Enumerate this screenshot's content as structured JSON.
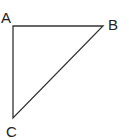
{
  "diagram": {
    "type": "triangle",
    "stroke_color": "#333333",
    "vertices": [
      {
        "label": "A",
        "x": 13,
        "y": 26,
        "label_x": 1,
        "label_y": 23
      },
      {
        "label": "B",
        "x": 103,
        "y": 26,
        "label_x": 108,
        "label_y": 30
      },
      {
        "label": "C",
        "x": 13,
        "y": 118,
        "label_x": 6,
        "label_y": 137
      }
    ],
    "edges": [
      {
        "from": "A",
        "to": "B"
      },
      {
        "from": "B",
        "to": "C"
      },
      {
        "from": "C",
        "to": "A"
      }
    ]
  }
}
